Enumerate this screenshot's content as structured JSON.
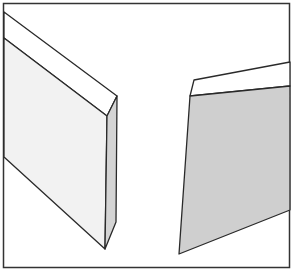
{
  "figure": {
    "colors": {
      "background": "#ffffff",
      "outline": "#2a2a2a",
      "left_face": "#f2f2f2",
      "left_side": "#d4d4d4",
      "left_bevel": "#ffffff",
      "right_face": "#cfcfcf",
      "right_bevel": "#ffffff",
      "frame": "#333333"
    }
  }
}
